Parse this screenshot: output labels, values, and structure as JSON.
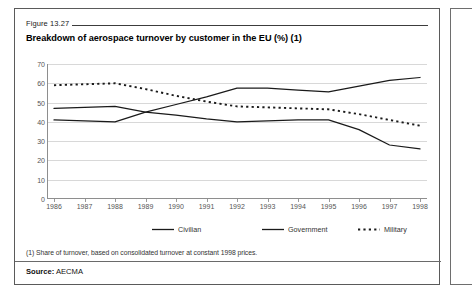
{
  "figure": {
    "number": "Figure 13.27",
    "title": "Breakdown of aerospace turnover by customer in the EU (%) (1)",
    "footnote": "(1) Share of turnover, based on consolidated turnover at constant 1998 prices.",
    "source_label": "Source:",
    "source_value": "AECMA"
  },
  "colors": {
    "line": "#1a1a1a",
    "grid": "#d8d8d8",
    "axis": "#8e8e8e",
    "panel_border": "#5a5a5a",
    "text": "#333333"
  },
  "chart_data": {
    "type": "line",
    "title": "Breakdown of aerospace turnover by customer in the EU (%) (1)",
    "xlabel": "",
    "ylabel": "",
    "ylim": [
      0,
      70
    ],
    "ytick_step": 10,
    "grid": true,
    "legend_position": "bottom",
    "categories": [
      "1986",
      "1987",
      "1988",
      "1989",
      "1990",
      "1991",
      "1992",
      "1993",
      "1994",
      "1995",
      "1996",
      "1997",
      "1998"
    ],
    "yticks": [
      0,
      10,
      20,
      30,
      40,
      50,
      60,
      70
    ],
    "series": [
      {
        "name": "Civilian",
        "style": "solid",
        "values": [
          41,
          40.5,
          40,
          45,
          49,
          53,
          57.5,
          57.5,
          56.5,
          55.5,
          58.5,
          61.5,
          63
        ]
      },
      {
        "name": "Government",
        "style": "solid",
        "values": [
          47,
          47.5,
          48,
          45,
          43.5,
          41.5,
          40,
          40.5,
          41,
          41,
          36,
          28,
          26
        ]
      },
      {
        "name": "Military",
        "style": "dotted",
        "values": [
          59,
          59.5,
          60,
          57,
          53.5,
          50.5,
          48,
          47.5,
          47,
          46.5,
          44,
          41,
          38
        ]
      }
    ]
  }
}
